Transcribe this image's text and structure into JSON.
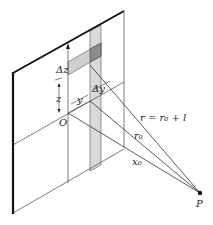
{
  "figure": {
    "labels": {
      "delta_z": "Δz",
      "z": "z",
      "delta_y": "Δy",
      "y": "y",
      "origin": "O",
      "r": "r = r₀ + l",
      "r0": "r₀",
      "x0": "x₀",
      "point": "P"
    },
    "colors": {
      "line": "#333333",
      "strip_fill": "#d6d6d6",
      "band_fill": "#c8c8c8",
      "overlap_fill": "#8a8a8a",
      "background": "#ffffff"
    }
  }
}
